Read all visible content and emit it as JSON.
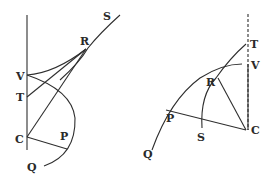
{
  "figures": [
    {
      "id": "left",
      "labels": {
        "S": "S",
        "R": "R",
        "V": "V",
        "T": "T",
        "C": "C",
        "P": "P",
        "Q": "Q"
      }
    },
    {
      "id": "right",
      "labels": {
        "T": "T",
        "V": "V",
        "R": "R",
        "P": "P",
        "C": "C",
        "S": "S",
        "Q": "Q"
      }
    }
  ],
  "colors": {
    "ink": "#2e2e2e",
    "background": "#ffffff"
  }
}
